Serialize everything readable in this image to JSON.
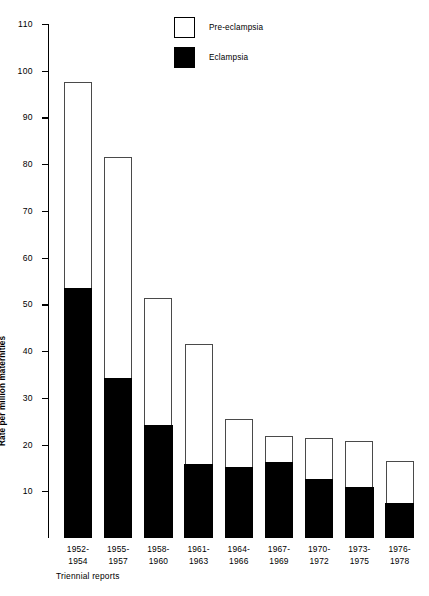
{
  "chart_data": {
    "type": "bar",
    "title": "",
    "subtitle": "",
    "xlabel": "Triennial reports",
    "ylabel": "Rate per million maternities",
    "ylim": [
      0,
      110
    ],
    "ytick_step": 10,
    "grid": false,
    "stacked": true,
    "legend_position": "top-center",
    "categories": [
      "1952-1954",
      "1955-1957",
      "1958-1960",
      "1961-1963",
      "1964-1966",
      "1967-1969",
      "1970-1972",
      "1973-1975",
      "1976-1978"
    ],
    "ytick_labels": [
      "10",
      "20",
      "30",
      "40",
      "50",
      "60",
      "70",
      "80",
      "90",
      "100",
      "110"
    ],
    "series": [
      {
        "name": "Eclampsia",
        "color": "#000000",
        "values": [
          53.5,
          34.3,
          24.3,
          15.8,
          15.3,
          16.3,
          12.7,
          11.0,
          7.6
        ]
      },
      {
        "name": "Pre-eclampsia",
        "color": "#ffffff",
        "values": [
          44.0,
          47.2,
          27.0,
          25.7,
          10.2,
          5.5,
          8.8,
          9.8,
          8.9
        ]
      }
    ],
    "totals": [
      97.5,
      81.5,
      51.3,
      41.5,
      25.5,
      21.8,
      21.5,
      20.8,
      16.5
    ]
  },
  "legend": {
    "items": [
      {
        "label": "Pre-eclampsia",
        "swatch": "hollow"
      },
      {
        "label": "Eclampsia",
        "swatch": "filled"
      }
    ]
  },
  "axes": {
    "y_title": "Rate per million maternities",
    "x_note": "Triennial reports"
  }
}
